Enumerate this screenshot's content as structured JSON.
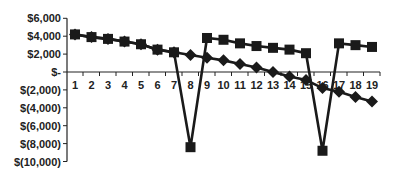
{
  "chart_data": {
    "type": "line",
    "title": "",
    "xlabel": "",
    "ylabel": "",
    "categories": [
      "1",
      "2",
      "3",
      "4",
      "5",
      "6",
      "7",
      "8",
      "9",
      "10",
      "11",
      "12",
      "13",
      "14",
      "15",
      "16",
      "17",
      "18",
      "19"
    ],
    "y_ticks": [
      "$6,000",
      "$4,000",
      "$2,000",
      "$-",
      "$(2,000)",
      "$(4,000)",
      "$(6,000)",
      "$(8,000)",
      "$(10,000)"
    ],
    "y_tick_values": [
      6000,
      4000,
      2000,
      0,
      -2000,
      -4000,
      -6000,
      -8000,
      -10000
    ],
    "ylim": [
      -10000,
      6000
    ],
    "grid": false,
    "legend": null,
    "series": [
      {
        "name": "Square series",
        "marker": "square",
        "color": "#1a1a1a",
        "values": [
          4200,
          3900,
          3700,
          3400,
          3100,
          2500,
          2200,
          -8400,
          3800,
          3600,
          3200,
          2900,
          2700,
          2500,
          2100,
          -8800,
          3200,
          3000,
          2800
        ]
      },
      {
        "name": "Diamond series",
        "marker": "diamond",
        "color": "#1a1a1a",
        "values": [
          4200,
          3900,
          3700,
          3400,
          3100,
          2500,
          2200,
          1900,
          1600,
          1300,
          900,
          500,
          0,
          -500,
          -900,
          -1800,
          -2200,
          -2800,
          -3300
        ]
      }
    ]
  }
}
